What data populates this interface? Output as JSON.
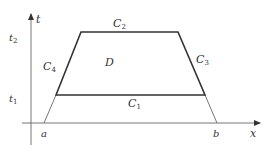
{
  "figure": {
    "axes": {
      "x_label": "x",
      "y_label": "t",
      "x_ticks": [
        "a",
        "b"
      ],
      "y_ticks": [
        "t1",
        "t2"
      ]
    },
    "region_label": "D",
    "curves": {
      "bottom": {
        "name": "C",
        "sub": "1"
      },
      "top": {
        "name": "C",
        "sub": "2"
      },
      "right": {
        "name": "C",
        "sub": "3"
      },
      "left": {
        "name": "C",
        "sub": "4"
      }
    },
    "colors": {
      "stroke": "#333333",
      "thin": "#555555"
    }
  }
}
